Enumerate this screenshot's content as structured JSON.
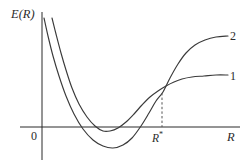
{
  "figure": {
    "background_color": "#ffffff",
    "stroke_color": "#3a3a3a",
    "axis_color": "#2b2b2b"
  },
  "labels": {
    "y_axis": "E(R)",
    "x_axis": "R",
    "origin": "0",
    "r_star_base": "R",
    "r_star_prime": "*",
    "curve_1": "1",
    "curve_2": "2"
  },
  "chart_data": {
    "type": "line",
    "title": "",
    "xlabel": "R",
    "ylabel": "E(R)",
    "grid": false,
    "legend_position": "right-inline",
    "axes": {
      "x_axis_pixel_y": 127,
      "y_axis_pixel_x": 42,
      "x_axis_start_px": 20,
      "x_axis_end_px": 240,
      "y_axis_top_px": 12,
      "y_axis_bottom_px": 160
    },
    "annotations": [
      {
        "name": "crossing-point",
        "label": "R*",
        "x_px": 162,
        "y_px": 93,
        "description": "Both potential curves intersect at R = R*, marked by a dashed vertical drop line to the R axis."
      }
    ],
    "series": [
      {
        "name": "1",
        "label": "1",
        "description": "Shallow potential well; minimum lies just below E=0, dissociation asymptote is low.",
        "minimum_px": {
          "x": 105,
          "y": 132
        },
        "asymptote_px_y": 75,
        "points_px": [
          [
            52,
            18
          ],
          [
            56,
            34
          ],
          [
            61,
            53
          ],
          [
            66,
            70
          ],
          [
            72,
            88
          ],
          [
            79,
            104
          ],
          [
            87,
            117
          ],
          [
            95,
            126
          ],
          [
            103,
            131
          ],
          [
            110,
            131
          ],
          [
            118,
            128
          ],
          [
            126,
            122
          ],
          [
            134,
            114
          ],
          [
            142,
            105
          ],
          [
            150,
            97
          ],
          [
            158,
            91
          ],
          [
            166,
            86
          ],
          [
            174,
            82
          ],
          [
            182,
            79
          ],
          [
            192,
            77
          ],
          [
            204,
            76
          ],
          [
            216,
            75
          ],
          [
            228,
            75
          ]
        ]
      },
      {
        "name": "2",
        "label": "2",
        "description": "Deeper potential well; minimum lies well below E=0, dissociation asymptote is high.",
        "minimum_px": {
          "x": 113,
          "y": 148
        },
        "asymptote_px_y": 36,
        "points_px": [
          [
            44,
            18
          ],
          [
            48,
            36
          ],
          [
            53,
            56
          ],
          [
            59,
            76
          ],
          [
            66,
            96
          ],
          [
            74,
            114
          ],
          [
            83,
            129
          ],
          [
            93,
            140
          ],
          [
            103,
            146
          ],
          [
            113,
            148
          ],
          [
            123,
            145
          ],
          [
            132,
            138
          ],
          [
            141,
            126
          ],
          [
            149,
            113
          ],
          [
            156,
            101
          ],
          [
            163,
            92
          ],
          [
            170,
            78
          ],
          [
            178,
            64
          ],
          [
            186,
            53
          ],
          [
            195,
            45
          ],
          [
            205,
            40
          ],
          [
            216,
            37
          ],
          [
            228,
            36
          ]
        ]
      }
    ]
  }
}
